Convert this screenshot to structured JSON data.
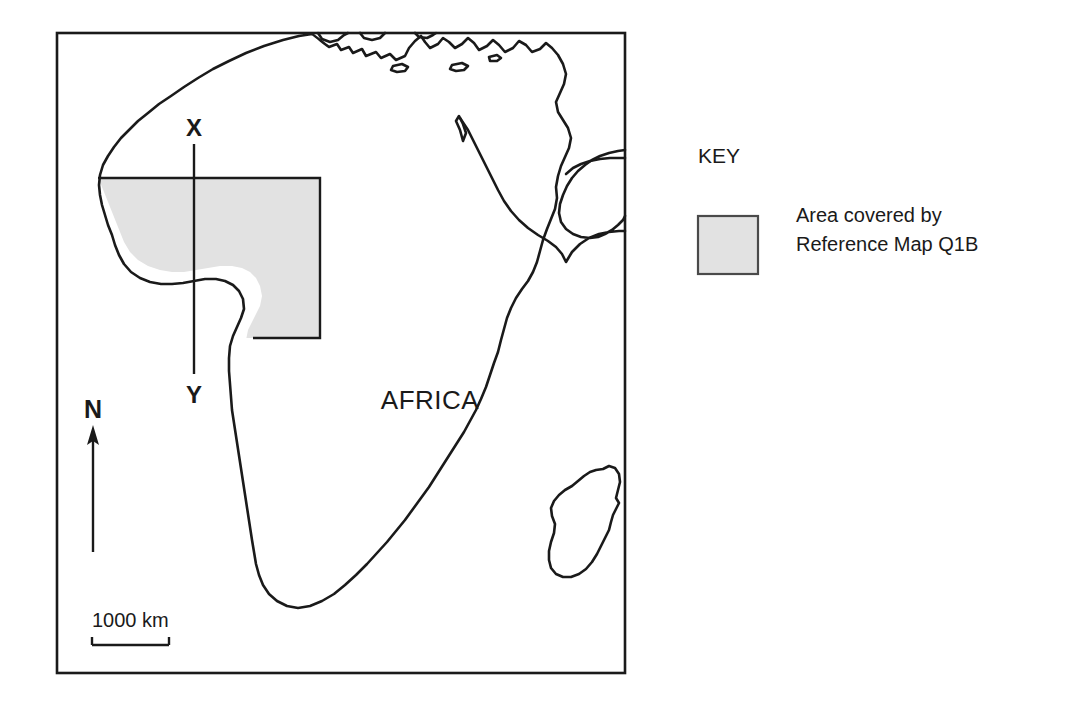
{
  "map": {
    "continent_label": "AFRICA",
    "transect": {
      "top_label": "X",
      "bottom_label": "Y"
    },
    "north_arrow": {
      "label": "N"
    },
    "scale_bar": {
      "label": "1000 km"
    },
    "frame": {
      "border_color": "#1a1a1a",
      "background_color": "#ffffff"
    },
    "coastline_color": "#1a1a1a",
    "shaded_area": {
      "fill_color": "#e2e2e2",
      "stroke_color": "#1a1a1a"
    }
  },
  "legend": {
    "title": "KEY",
    "items": [
      {
        "swatch_color": "#e2e2e2",
        "swatch_border_color": "#4a4a4a",
        "label_line1": "Area covered by",
        "label_line2": "Reference Map Q1B"
      }
    ]
  }
}
